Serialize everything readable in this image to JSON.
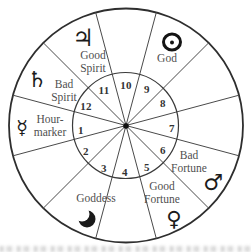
{
  "figure": {
    "type": "astrological-houses-wheel",
    "houses": [
      {
        "number": "1",
        "name": "Hour-marker",
        "planet": "Mercury"
      },
      {
        "number": "2"
      },
      {
        "number": "3",
        "name": "Goddess",
        "planet": "Moon"
      },
      {
        "number": "4"
      },
      {
        "number": "5",
        "name": "Good Fortune",
        "planet": "Venus"
      },
      {
        "number": "6",
        "name": "Bad Fortune",
        "planet": "Mars"
      },
      {
        "number": "7"
      },
      {
        "number": "8"
      },
      {
        "number": "9",
        "name": "God",
        "planet": "Sun"
      },
      {
        "number": "10"
      },
      {
        "number": "11",
        "name": "Good Spirit",
        "planet": "Jupiter"
      },
      {
        "number": "12",
        "name": "Bad Spirit",
        "planet": "Saturn"
      }
    ],
    "labels": {
      "good_spirit": "Good\nSpirit",
      "bad_spirit": "Bad\nSpirit",
      "hour_marker": "Hour-\nmarker",
      "goddess": "Goddess",
      "good_fortune": "Good\nFortune",
      "bad_fortune": "Bad\nFortune",
      "god": "God"
    },
    "symbols": {
      "jupiter": "♃",
      "saturn": "♄",
      "mercury": "☿",
      "venus": "♀",
      "mars": "♂",
      "sun": "☉",
      "moon": "☽"
    },
    "colors": {
      "line": "#3c3c3c",
      "outer_ring": "#2e2e2e",
      "label_text": "#4f4f4f",
      "glyph": "#1b1b1b",
      "background": "#ffffff"
    }
  }
}
